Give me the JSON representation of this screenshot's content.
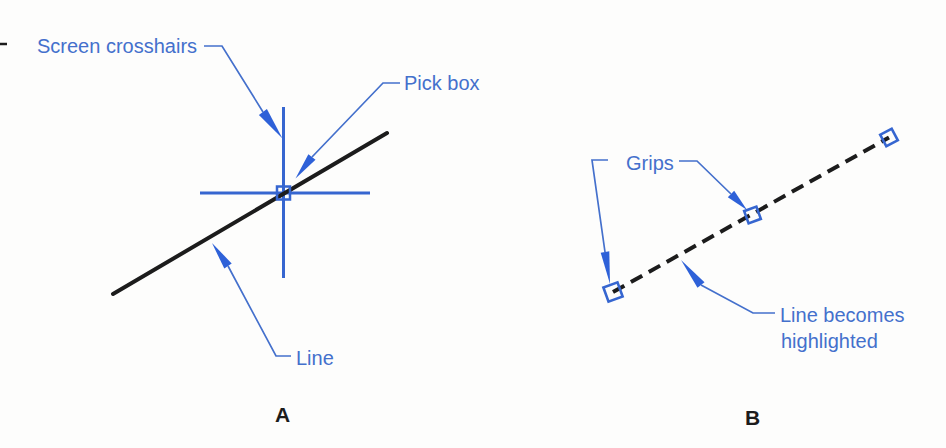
{
  "figure": {
    "panel_a_letter": "A",
    "panel_b_letter": "B"
  },
  "labels": {
    "screen_crosshairs": "Screen crosshairs",
    "pick_box": "Pick box",
    "line": "Line",
    "grips": "Grips",
    "highlight_line1": "Line becomes",
    "highlight_line2": "highlighted"
  },
  "colors": {
    "background": "#fdfdfc",
    "accent_blue": "#4470cc",
    "line_blue": "#3666d0",
    "arrow_blue": "#2e61d8",
    "ink_black": "#1c1c1c"
  }
}
